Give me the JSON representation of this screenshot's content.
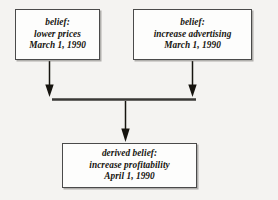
{
  "diagram": {
    "background_color": "#f4f3f1",
    "stroke_color": "#16140f",
    "box_fill_color": "#fdfdfc",
    "nodes": [
      {
        "id": "belief-lower-prices",
        "role": "premise",
        "lines": [
          "belief:",
          "lower prices",
          "March 1, 1990"
        ],
        "label": "belief:",
        "content": "lower prices",
        "date": "March 1, 1990"
      },
      {
        "id": "belief-increase-advertising",
        "role": "premise",
        "lines": [
          "belief:",
          "increase advertising",
          "March 1, 1990"
        ],
        "label": "belief:",
        "content": "increase advertising",
        "date": "March 1, 1990"
      },
      {
        "id": "derived-belief",
        "role": "conclusion",
        "lines": [
          "derived belief:",
          "increase profitability",
          "April 1, 1990"
        ],
        "label": "derived belief:",
        "content": "increase profitability",
        "date": "April 1, 1990"
      }
    ],
    "connectors": [
      {
        "id": "arrow-left-premise-to-join",
        "from": "belief-lower-prices",
        "to": "join-bar",
        "direction": "down"
      },
      {
        "id": "arrow-right-premise-to-join",
        "from": "belief-increase-advertising",
        "to": "join-bar",
        "direction": "down"
      },
      {
        "id": "join-bar",
        "type": "horizontal-join-bar",
        "from": "arrow-left-premise-to-join",
        "to": "arrow-right-premise-to-join"
      },
      {
        "id": "arrow-join-to-conclusion",
        "from": "join-bar",
        "to": "derived-belief",
        "direction": "down"
      }
    ]
  }
}
